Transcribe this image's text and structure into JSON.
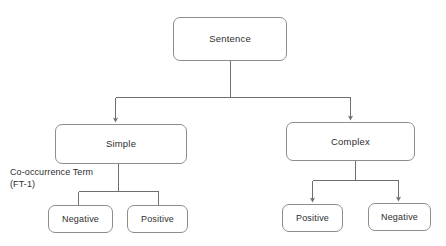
{
  "diagram": {
    "background_color": "#ffffff",
    "node_border_color": "#8d8d8d",
    "node_fill_color": "#ffffff",
    "connector_color": "#6e6e6e",
    "text_color": "#2e2e2e",
    "root": {
      "label": "Sentence"
    },
    "branches": [
      {
        "label": "Simple",
        "children": [
          {
            "label": "Negative"
          },
          {
            "label": "Positive"
          }
        ]
      },
      {
        "label": "Complex",
        "children": [
          {
            "label": "Positive"
          },
          {
            "label": "Negative"
          }
        ]
      }
    ],
    "annotation": {
      "line1": "Co-occurrence Term",
      "line2": "(FT-1)"
    }
  }
}
